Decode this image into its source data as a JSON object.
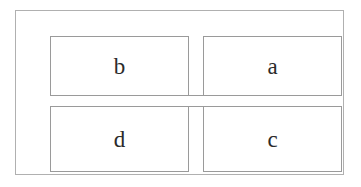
{
  "figure": {
    "type": "quadrant-matrix",
    "background_color": "#ffffff",
    "frame_border_color": "#b0b0b0",
    "cell_border_color": "#9a9a9a",
    "text_color": "#2b2b2b"
  },
  "matrix": {
    "rows": 2,
    "columns": 2,
    "cells": [
      {
        "id": "top-left",
        "label": "b"
      },
      {
        "id": "top-right",
        "label": "a"
      },
      {
        "id": "bottom-left",
        "label": "d"
      },
      {
        "id": "bottom-right",
        "label": "c"
      }
    ]
  }
}
